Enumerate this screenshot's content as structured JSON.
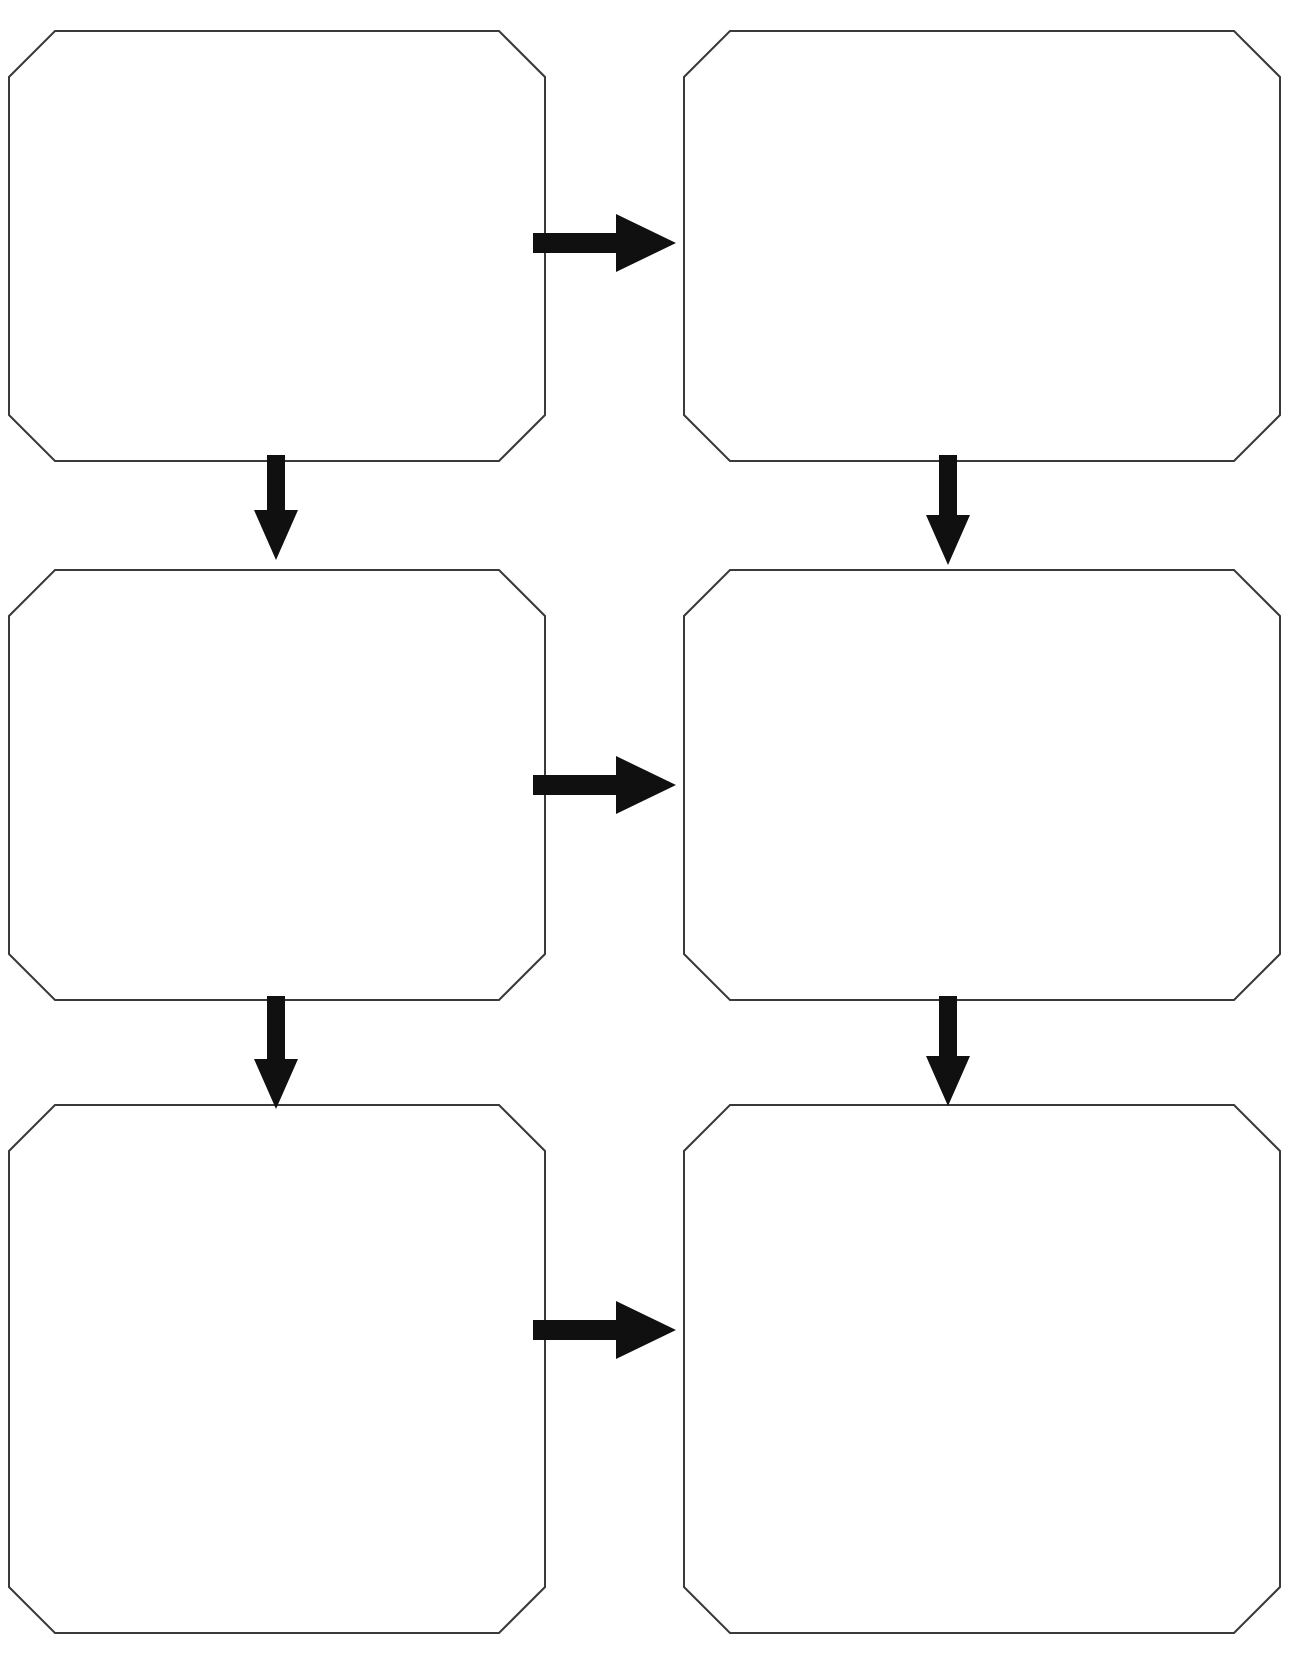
{
  "page": {
    "width": 1291,
    "height": 1663,
    "background_color": "#ffffff",
    "title": "Blank Flowchart Graphic Organizer"
  },
  "style": {
    "box_fill": "#ffffff",
    "box_stroke": "#3a3a3a",
    "box_stroke_width": 2,
    "box_corner_bevel": 46,
    "arrow_color": "#101010"
  },
  "boxes": [
    {
      "id": "box-1",
      "label": "",
      "placeholder": "",
      "row": 1,
      "column": "left",
      "x": 9,
      "y": 31,
      "width": 536,
      "height": 430
    },
    {
      "id": "box-2",
      "label": "",
      "placeholder": "",
      "row": 1,
      "column": "right",
      "x": 684,
      "y": 31,
      "width": 596,
      "height": 430
    },
    {
      "id": "box-3",
      "label": "",
      "placeholder": "",
      "row": 2,
      "column": "left",
      "x": 9,
      "y": 570,
      "width": 536,
      "height": 430
    },
    {
      "id": "box-4",
      "label": "",
      "placeholder": "",
      "row": 2,
      "column": "right",
      "x": 684,
      "y": 570,
      "width": 596,
      "height": 430
    },
    {
      "id": "box-5",
      "label": "",
      "placeholder": "",
      "row": 3,
      "column": "left",
      "x": 9,
      "y": 1105,
      "width": 536,
      "height": 528
    },
    {
      "id": "box-6",
      "label": "",
      "placeholder": "",
      "row": 3,
      "column": "right",
      "x": 684,
      "y": 1105,
      "width": 596,
      "height": 528
    }
  ],
  "arrows": [
    {
      "id": "arrow-1",
      "direction": "right",
      "from": "box-1",
      "to": "box-2",
      "x": 533,
      "y": 243,
      "length": 143,
      "shaft_thickness": 20,
      "head_width": 60,
      "head_height": 58
    },
    {
      "id": "arrow-2",
      "direction": "down",
      "from": "box-1",
      "to": "box-3",
      "x": 276,
      "y": 455,
      "length": 105,
      "shaft_thickness": 18,
      "head_width": 44,
      "head_height": 50
    },
    {
      "id": "arrow-3",
      "direction": "down",
      "from": "box-2",
      "to": "box-4",
      "x": 948,
      "y": 455,
      "length": 110,
      "shaft_thickness": 18,
      "head_width": 44,
      "head_height": 50
    },
    {
      "id": "arrow-4",
      "direction": "right",
      "from": "box-3",
      "to": "box-4",
      "x": 533,
      "y": 785,
      "length": 143,
      "shaft_thickness": 20,
      "head_width": 60,
      "head_height": 58
    },
    {
      "id": "arrow-5",
      "direction": "down",
      "from": "box-3",
      "to": "box-5",
      "x": 276,
      "y": 996,
      "length": 113,
      "shaft_thickness": 18,
      "head_width": 44,
      "head_height": 50
    },
    {
      "id": "arrow-6",
      "direction": "down",
      "from": "box-4",
      "to": "box-6",
      "x": 948,
      "y": 996,
      "length": 110,
      "shaft_thickness": 18,
      "head_width": 44,
      "head_height": 50
    },
    {
      "id": "arrow-7",
      "direction": "right",
      "from": "box-5",
      "to": "box-6",
      "x": 533,
      "y": 1330,
      "length": 143,
      "shaft_thickness": 20,
      "head_width": 60,
      "head_height": 58
    }
  ]
}
